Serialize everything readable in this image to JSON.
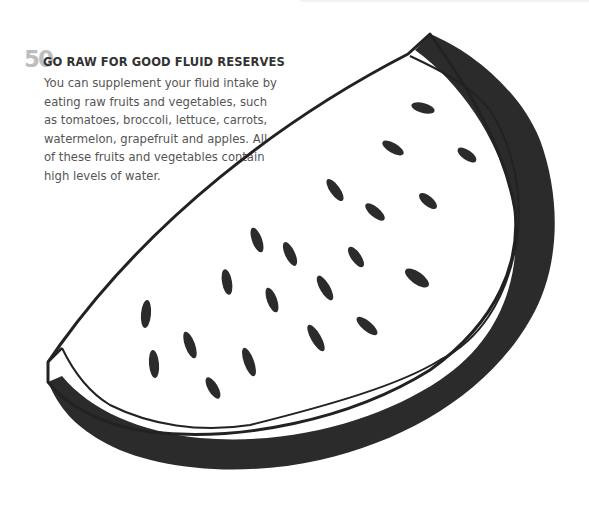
{
  "tip": {
    "number": "50",
    "title": "GO RAW FOR GOOD FLUID RESERVES",
    "body_lines": [
      "You can supplement your fluid intake by",
      "eating raw fruits and vegetables, such",
      "as tomatoes, broccoli, lettuce, carrots,",
      "watermelon, grapefruit and apples. All",
      "of these fruits and vegetables contain",
      "high levels of water."
    ]
  },
  "illustration": {
    "subject": "watermelon-slice",
    "rind_color": "#2b2b2b",
    "outline_color": "#222222",
    "seed_color": "#2b2b2b",
    "seed_count": 20
  }
}
